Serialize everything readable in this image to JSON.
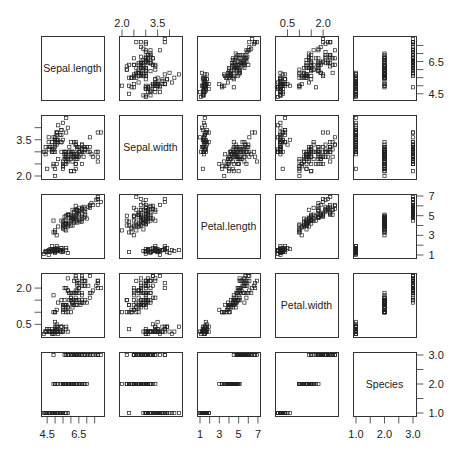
{
  "chart_data": {
    "type": "scatter",
    "subtype": "scatterplot-matrix",
    "title": "",
    "variables": [
      "Sepal.length",
      "Sepal.width",
      "Petal.length",
      "Petal.width",
      "Species"
    ],
    "ranges": {
      "Sepal.length": [
        4.3,
        7.9
      ],
      "Sepal.width": [
        2.0,
        4.4
      ],
      "Petal.length": [
        1.0,
        6.9
      ],
      "Petal.width": [
        0.1,
        2.5
      ],
      "Species": [
        1.0,
        3.0
      ]
    },
    "axis_ticks": {
      "Sepal.length": {
        "side": "bottom-and-right",
        "ticks": [
          4.5,
          5.0,
          5.5,
          6.0,
          6.5,
          7.0,
          7.5
        ],
        "labels": [
          "4.5",
          "6.5"
        ]
      },
      "Sepal.width": {
        "side": "top-and-left",
        "ticks": [
          2.0,
          2.5,
          3.0,
          3.5,
          4.0
        ],
        "labels": [
          "2.0",
          "3.5"
        ]
      },
      "Petal.length": {
        "side": "bottom-and-right",
        "ticks": [
          1,
          2,
          3,
          4,
          5,
          6,
          7
        ],
        "labels": [
          "1",
          "3",
          "5",
          "7"
        ]
      },
      "Petal.width": {
        "side": "top-and-left",
        "ticks": [
          0.5,
          1.0,
          1.5,
          2.0
        ],
        "labels": [
          "0.5",
          "2.0"
        ]
      },
      "Species": {
        "side": "bottom-and-right",
        "ticks": [
          1.0,
          1.5,
          2.0,
          2.5,
          3.0
        ],
        "labels": [
          "1.0",
          "2.0",
          "3.0"
        ]
      }
    },
    "right_axis_labels": {
      "Sepal.length": [
        "6.5",
        "4.5"
      ],
      "Petal.length": [
        "7",
        "5",
        "3",
        "1"
      ],
      "Species": [
        "3.0",
        "2.0",
        "1.0"
      ]
    },
    "grid": false,
    "legend": "none",
    "observations": [
      [
        5.1,
        3.5,
        1.4,
        0.2,
        1
      ],
      [
        4.9,
        3.0,
        1.4,
        0.2,
        1
      ],
      [
        4.7,
        3.2,
        1.3,
        0.2,
        1
      ],
      [
        4.6,
        3.1,
        1.5,
        0.2,
        1
      ],
      [
        5.0,
        3.6,
        1.4,
        0.2,
        1
      ],
      [
        5.4,
        3.9,
        1.7,
        0.4,
        1
      ],
      [
        4.6,
        3.4,
        1.4,
        0.3,
        1
      ],
      [
        5.0,
        3.4,
        1.5,
        0.2,
        1
      ],
      [
        4.4,
        2.9,
        1.4,
        0.2,
        1
      ],
      [
        4.9,
        3.1,
        1.5,
        0.1,
        1
      ],
      [
        5.4,
        3.7,
        1.5,
        0.2,
        1
      ],
      [
        4.8,
        3.4,
        1.6,
        0.2,
        1
      ],
      [
        4.8,
        3.0,
        1.4,
        0.1,
        1
      ],
      [
        4.3,
        3.0,
        1.1,
        0.1,
        1
      ],
      [
        5.8,
        4.0,
        1.2,
        0.2,
        1
      ],
      [
        5.7,
        4.4,
        1.5,
        0.4,
        1
      ],
      [
        5.4,
        3.9,
        1.3,
        0.4,
        1
      ],
      [
        5.1,
        3.5,
        1.4,
        0.3,
        1
      ],
      [
        5.7,
        3.8,
        1.7,
        0.3,
        1
      ],
      [
        5.1,
        3.8,
        1.5,
        0.3,
        1
      ],
      [
        5.4,
        3.4,
        1.7,
        0.2,
        1
      ],
      [
        5.1,
        3.7,
        1.5,
        0.4,
        1
      ],
      [
        4.6,
        3.6,
        1.0,
        0.2,
        1
      ],
      [
        5.1,
        3.3,
        1.7,
        0.5,
        1
      ],
      [
        4.8,
        3.4,
        1.9,
        0.2,
        1
      ],
      [
        5.0,
        3.0,
        1.6,
        0.2,
        1
      ],
      [
        5.0,
        3.4,
        1.6,
        0.4,
        1
      ],
      [
        5.2,
        3.5,
        1.5,
        0.2,
        1
      ],
      [
        5.2,
        3.4,
        1.4,
        0.2,
        1
      ],
      [
        4.7,
        3.2,
        1.6,
        0.2,
        1
      ],
      [
        4.8,
        3.1,
        1.6,
        0.2,
        1
      ],
      [
        5.4,
        3.4,
        1.5,
        0.4,
        1
      ],
      [
        5.2,
        4.1,
        1.5,
        0.1,
        1
      ],
      [
        5.5,
        4.2,
        1.4,
        0.2,
        1
      ],
      [
        4.9,
        3.1,
        1.5,
        0.2,
        1
      ],
      [
        5.0,
        3.2,
        1.2,
        0.2,
        1
      ],
      [
        5.5,
        3.5,
        1.3,
        0.2,
        1
      ],
      [
        4.9,
        3.6,
        1.4,
        0.1,
        1
      ],
      [
        4.4,
        3.0,
        1.3,
        0.2,
        1
      ],
      [
        5.1,
        3.4,
        1.5,
        0.2,
        1
      ],
      [
        5.0,
        3.5,
        1.3,
        0.3,
        1
      ],
      [
        4.5,
        2.3,
        1.3,
        0.3,
        1
      ],
      [
        4.4,
        3.2,
        1.3,
        0.2,
        1
      ],
      [
        5.0,
        3.5,
        1.6,
        0.6,
        1
      ],
      [
        5.1,
        3.8,
        1.9,
        0.4,
        1
      ],
      [
        4.8,
        3.0,
        1.4,
        0.3,
        1
      ],
      [
        5.1,
        3.8,
        1.6,
        0.2,
        1
      ],
      [
        4.6,
        3.2,
        1.4,
        0.2,
        1
      ],
      [
        5.3,
        3.7,
        1.5,
        0.2,
        1
      ],
      [
        5.0,
        3.3,
        1.4,
        0.2,
        1
      ],
      [
        7.0,
        3.2,
        4.7,
        1.4,
        2
      ],
      [
        6.4,
        3.2,
        4.5,
        1.5,
        2
      ],
      [
        6.9,
        3.1,
        4.9,
        1.5,
        2
      ],
      [
        5.5,
        2.3,
        4.0,
        1.3,
        2
      ],
      [
        6.5,
        2.8,
        4.6,
        1.5,
        2
      ],
      [
        5.7,
        2.8,
        4.5,
        1.3,
        2
      ],
      [
        6.3,
        3.3,
        4.7,
        1.6,
        2
      ],
      [
        4.9,
        2.4,
        3.3,
        1.0,
        2
      ],
      [
        6.6,
        2.9,
        4.6,
        1.3,
        2
      ],
      [
        5.2,
        2.7,
        3.9,
        1.4,
        2
      ],
      [
        5.0,
        2.0,
        3.5,
        1.0,
        2
      ],
      [
        5.9,
        3.0,
        4.2,
        1.5,
        2
      ],
      [
        6.0,
        2.2,
        4.0,
        1.0,
        2
      ],
      [
        6.1,
        2.9,
        4.7,
        1.4,
        2
      ],
      [
        5.6,
        2.9,
        3.6,
        1.3,
        2
      ],
      [
        6.7,
        3.1,
        4.4,
        1.4,
        2
      ],
      [
        5.6,
        3.0,
        4.5,
        1.5,
        2
      ],
      [
        5.8,
        2.7,
        4.1,
        1.0,
        2
      ],
      [
        6.2,
        2.2,
        4.5,
        1.5,
        2
      ],
      [
        5.6,
        2.5,
        3.9,
        1.1,
        2
      ],
      [
        5.9,
        3.2,
        4.8,
        1.8,
        2
      ],
      [
        6.1,
        2.8,
        4.0,
        1.3,
        2
      ],
      [
        6.3,
        2.5,
        4.9,
        1.5,
        2
      ],
      [
        6.1,
        2.8,
        4.7,
        1.2,
        2
      ],
      [
        6.4,
        2.9,
        4.3,
        1.3,
        2
      ],
      [
        6.6,
        3.0,
        4.4,
        1.4,
        2
      ],
      [
        6.8,
        2.8,
        4.8,
        1.4,
        2
      ],
      [
        6.7,
        3.0,
        5.0,
        1.7,
        2
      ],
      [
        6.0,
        2.9,
        4.5,
        1.5,
        2
      ],
      [
        5.7,
        2.6,
        3.5,
        1.0,
        2
      ],
      [
        5.5,
        2.4,
        3.8,
        1.1,
        2
      ],
      [
        5.5,
        2.4,
        3.7,
        1.0,
        2
      ],
      [
        5.8,
        2.7,
        3.9,
        1.2,
        2
      ],
      [
        6.0,
        2.7,
        5.1,
        1.6,
        2
      ],
      [
        5.4,
        3.0,
        4.5,
        1.5,
        2
      ],
      [
        6.0,
        3.4,
        4.5,
        1.6,
        2
      ],
      [
        6.7,
        3.1,
        4.7,
        1.5,
        2
      ],
      [
        6.3,
        2.3,
        4.4,
        1.3,
        2
      ],
      [
        5.6,
        3.0,
        4.1,
        1.3,
        2
      ],
      [
        5.5,
        2.5,
        4.0,
        1.3,
        2
      ],
      [
        5.5,
        2.6,
        4.4,
        1.2,
        2
      ],
      [
        6.1,
        3.0,
        4.6,
        1.4,
        2
      ],
      [
        5.8,
        2.6,
        4.0,
        1.2,
        2
      ],
      [
        5.0,
        2.3,
        3.3,
        1.0,
        2
      ],
      [
        5.6,
        2.7,
        4.2,
        1.3,
        2
      ],
      [
        5.7,
        3.0,
        4.2,
        1.2,
        2
      ],
      [
        5.7,
        2.9,
        4.2,
        1.3,
        2
      ],
      [
        6.2,
        2.9,
        4.3,
        1.3,
        2
      ],
      [
        5.1,
        2.5,
        3.0,
        1.1,
        2
      ],
      [
        5.7,
        2.8,
        4.1,
        1.3,
        2
      ],
      [
        6.3,
        3.3,
        6.0,
        2.5,
        3
      ],
      [
        5.8,
        2.7,
        5.1,
        1.9,
        3
      ],
      [
        7.1,
        3.0,
        5.9,
        2.1,
        3
      ],
      [
        6.3,
        2.9,
        5.6,
        1.8,
        3
      ],
      [
        6.5,
        3.0,
        5.8,
        2.2,
        3
      ],
      [
        7.6,
        3.0,
        6.6,
        2.1,
        3
      ],
      [
        4.9,
        2.5,
        4.5,
        1.7,
        3
      ],
      [
        7.3,
        2.9,
        6.3,
        1.8,
        3
      ],
      [
        6.7,
        2.5,
        5.8,
        1.8,
        3
      ],
      [
        7.2,
        3.6,
        6.1,
        2.5,
        3
      ],
      [
        6.5,
        3.2,
        5.1,
        2.0,
        3
      ],
      [
        6.4,
        2.7,
        5.3,
        1.9,
        3
      ],
      [
        6.8,
        3.0,
        5.5,
        2.1,
        3
      ],
      [
        5.7,
        2.5,
        5.0,
        2.0,
        3
      ],
      [
        5.8,
        2.8,
        5.1,
        2.4,
        3
      ],
      [
        6.4,
        3.2,
        5.3,
        2.3,
        3
      ],
      [
        6.5,
        3.0,
        5.5,
        1.8,
        3
      ],
      [
        7.7,
        3.8,
        6.7,
        2.2,
        3
      ],
      [
        7.7,
        2.6,
        6.9,
        2.3,
        3
      ],
      [
        6.0,
        2.2,
        5.0,
        1.5,
        3
      ],
      [
        6.9,
        3.2,
        5.7,
        2.3,
        3
      ],
      [
        5.6,
        2.8,
        4.9,
        2.0,
        3
      ],
      [
        7.7,
        2.8,
        6.7,
        2.0,
        3
      ],
      [
        6.3,
        2.7,
        4.9,
        1.8,
        3
      ],
      [
        6.7,
        3.3,
        5.7,
        2.1,
        3
      ],
      [
        7.2,
        3.2,
        6.0,
        1.8,
        3
      ],
      [
        6.2,
        2.8,
        4.8,
        1.8,
        3
      ],
      [
        6.1,
        3.0,
        4.9,
        1.8,
        3
      ],
      [
        6.4,
        2.8,
        5.6,
        2.1,
        3
      ],
      [
        7.2,
        3.0,
        5.8,
        1.6,
        3
      ],
      [
        7.4,
        2.8,
        6.1,
        1.9,
        3
      ],
      [
        7.9,
        3.8,
        6.4,
        2.0,
        3
      ],
      [
        6.4,
        2.8,
        5.6,
        2.2,
        3
      ],
      [
        6.3,
        2.8,
        5.1,
        1.5,
        3
      ],
      [
        6.1,
        2.6,
        5.6,
        1.4,
        3
      ],
      [
        7.7,
        3.0,
        6.1,
        2.3,
        3
      ],
      [
        6.3,
        3.4,
        5.6,
        2.4,
        3
      ],
      [
        6.4,
        3.1,
        5.5,
        1.8,
        3
      ],
      [
        6.0,
        3.0,
        4.8,
        1.8,
        3
      ],
      [
        6.9,
        3.1,
        5.4,
        2.1,
        3
      ],
      [
        6.7,
        3.1,
        5.6,
        2.4,
        3
      ],
      [
        6.9,
        3.1,
        5.1,
        2.3,
        3
      ],
      [
        5.8,
        2.7,
        5.1,
        1.9,
        3
      ],
      [
        6.8,
        3.2,
        5.9,
        2.3,
        3
      ],
      [
        6.7,
        3.3,
        5.7,
        2.5,
        3
      ],
      [
        6.7,
        3.0,
        5.2,
        2.3,
        3
      ],
      [
        6.3,
        2.5,
        5.0,
        1.9,
        3
      ],
      [
        6.5,
        3.0,
        5.2,
        2.0,
        3
      ],
      [
        6.2,
        3.4,
        5.4,
        2.3,
        3
      ],
      [
        5.9,
        3.0,
        5.1,
        1.8,
        3
      ]
    ]
  }
}
